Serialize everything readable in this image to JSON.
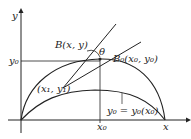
{
  "figure": {
    "axis_x_label": "x",
    "axis_y_label": "y",
    "y0_label": "y₀",
    "x0_label": "x₀",
    "x_end_label": "x",
    "theta_label": "θ",
    "point_B_label": "B(x, y)",
    "point_B0_label": "B₀(x₀, y₀)",
    "point_1_label": "(x₁, y₁)",
    "curve_label": "y₀ = y₀(x₀)"
  }
}
